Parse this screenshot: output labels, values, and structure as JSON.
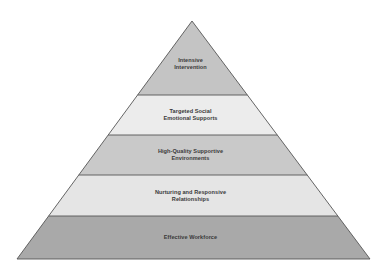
{
  "diagram": {
    "type": "pyramid",
    "apex": {
      "x": 192,
      "y": 21
    },
    "base": {
      "y": 259,
      "left_x": 17,
      "right_x": 370
    },
    "outline_color": "#555555",
    "layers": [
      {
        "id": "intensive-intervention",
        "line1": "Intensive",
        "line2": "Intervention",
        "y_top": 21,
        "y_bottom": 95,
        "fill": "#c4c4c4"
      },
      {
        "id": "targeted-social-emotional-supports",
        "line1": "Targeted Social",
        "line2": "Emotional Supports",
        "y_top": 95,
        "y_bottom": 135,
        "fill": "#ececec"
      },
      {
        "id": "high-quality-supportive-environments",
        "line1": "High-Quality Supportive",
        "line2": "Environments",
        "y_top": 135,
        "y_bottom": 175,
        "fill": "#c9c9c9"
      },
      {
        "id": "nurturing-and-responsive-relationships",
        "line1": "Nurturing and Responsive",
        "line2": "Relationships",
        "y_top": 175,
        "y_bottom": 216,
        "fill": "#e5e5e5"
      },
      {
        "id": "effective-workforce",
        "line1": "Effective Workforce",
        "line2": "",
        "y_top": 216,
        "y_bottom": 259,
        "fill": "#a9a9a9"
      }
    ]
  }
}
